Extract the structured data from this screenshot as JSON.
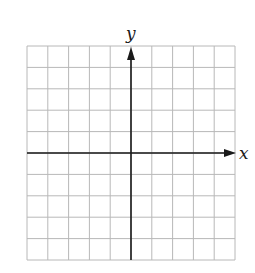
{
  "diagram": {
    "type": "coordinate-grid",
    "grid": {
      "columns": 10,
      "rows": 10,
      "line_color": "#b8b8b8",
      "axis_color": "#1a1a1a"
    },
    "axes": {
      "x_label": "x",
      "y_label": "y",
      "origin_cell": {
        "col": 5,
        "row": 5
      }
    }
  }
}
